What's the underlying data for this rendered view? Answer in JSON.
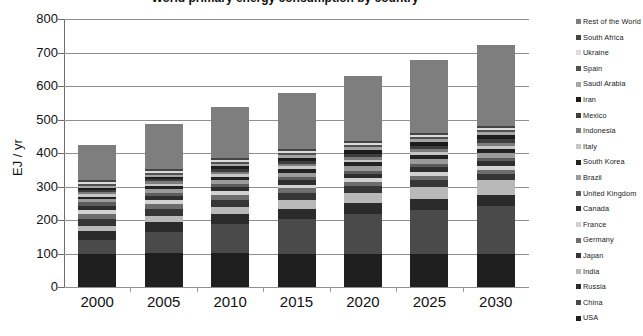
{
  "chart_data": {
    "type": "bar",
    "subtype": "stacked-column",
    "title": "World primary energy consumption by country",
    "xlabel": "",
    "ylabel": "EJ / yr",
    "ylim": [
      0,
      800
    ],
    "ytick_step": 100,
    "yticks": [
      "0",
      "100",
      "200",
      "300",
      "400",
      "500",
      "600",
      "700",
      "800"
    ],
    "grid": true,
    "legend_position": "right",
    "categories": [
      "2000",
      "2005",
      "2010",
      "2015",
      "2020",
      "2025",
      "2030"
    ],
    "totals": [
      425,
      487,
      538,
      580,
      630,
      678,
      722
    ],
    "series": [
      {
        "name": "USA",
        "color": "#201f1f",
        "values": [
          100,
          103,
          101,
          100,
          100,
          99,
          98
        ]
      },
      {
        "name": "China",
        "color": "#4a4a4a",
        "values": [
          40,
          62,
          88,
          103,
          118,
          131,
          144
        ]
      },
      {
        "name": "Russia",
        "color": "#2b2b2b",
        "values": [
          28,
          29,
          30,
          31,
          32,
          33,
          34
        ]
      },
      {
        "name": "India",
        "color": "#b9b9b9",
        "values": [
          14,
          17,
          21,
          26,
          31,
          37,
          43
        ]
      },
      {
        "name": "Japan",
        "color": "#363636",
        "values": [
          22,
          22,
          21,
          21,
          20,
          20,
          19
        ]
      },
      {
        "name": "Germany",
        "color": "#6d6d6d",
        "values": [
          15,
          15,
          14,
          14,
          13,
          13,
          12
        ]
      },
      {
        "name": "France",
        "color": "#d2d2d2",
        "values": [
          11,
          11,
          11,
          11,
          11,
          11,
          11
        ]
      },
      {
        "name": "Canada",
        "color": "#2e2e2e",
        "values": [
          13,
          13,
          14,
          14,
          14,
          15,
          15
        ]
      },
      {
        "name": "United Kingdom",
        "color": "#5c5c5c",
        "values": [
          10,
          10,
          9,
          9,
          9,
          9,
          8
        ]
      },
      {
        "name": "Brazil",
        "color": "#9b9b9b",
        "values": [
          9,
          10,
          11,
          12,
          13,
          14,
          15
        ]
      },
      {
        "name": "South Korea",
        "color": "#232323",
        "values": [
          8,
          9,
          10,
          11,
          11,
          12,
          13
        ]
      },
      {
        "name": "Italy",
        "color": "#c6c6c6",
        "values": [
          8,
          8,
          8,
          8,
          8,
          8,
          8
        ]
      },
      {
        "name": "Indonesia",
        "color": "#7c7c7c",
        "values": [
          6,
          7,
          7,
          8,
          9,
          10,
          11
        ]
      },
      {
        "name": "Mexico",
        "color": "#3d3d3d",
        "values": [
          7,
          7,
          8,
          8,
          9,
          9,
          10
        ]
      },
      {
        "name": "Iran",
        "color": "#1c1c1c",
        "values": [
          6,
          7,
          8,
          9,
          10,
          11,
          12
        ]
      },
      {
        "name": "Saudi Arabia",
        "color": "#a6a6a6",
        "values": [
          5,
          6,
          7,
          8,
          9,
          10,
          11
        ]
      },
      {
        "name": "Spain",
        "color": "#505050",
        "values": [
          6,
          6,
          6,
          6,
          6,
          6,
          6
        ]
      },
      {
        "name": "Ukraine",
        "color": "#dcdcdc",
        "values": [
          6,
          6,
          6,
          6,
          6,
          6,
          6
        ]
      },
      {
        "name": "South Africa",
        "color": "#444444",
        "values": [
          5,
          5,
          5,
          6,
          6,
          6,
          6
        ]
      },
      {
        "name": "Rest of the World",
        "color": "#7e7e7e",
        "values": [
          106,
          134,
          153,
          169,
          195,
          218,
          240
        ]
      }
    ]
  }
}
